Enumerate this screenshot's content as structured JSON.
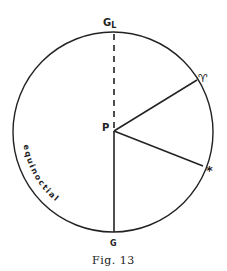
{
  "diagram": {
    "labels": {
      "top": "G",
      "top_sub": "L",
      "center": "P",
      "aries": "♈",
      "star": "*",
      "bottom": "G",
      "arc": "equinoctial"
    },
    "caption": "Fig. 13",
    "colors": {
      "stroke": "#222222",
      "background": "#ffffff"
    },
    "geometry": {
      "circle": {
        "cx": 113,
        "cy": 132,
        "r": 100
      },
      "center_point": {
        "x": 114,
        "y": 130
      },
      "aries_point": {
        "x": 197,
        "y": 80
      },
      "star_point": {
        "x": 203,
        "y": 166
      }
    }
  }
}
